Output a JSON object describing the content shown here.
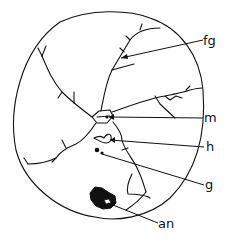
{
  "figure": {
    "type": "line-drawing",
    "labels": [
      {
        "id": "fg",
        "text": "fg",
        "x": 203,
        "y": 34,
        "target": [
          121,
          58
        ]
      },
      {
        "id": "m",
        "text": "m",
        "x": 205,
        "y": 111,
        "target": [
          106,
          117
        ]
      },
      {
        "id": "h",
        "text": "h",
        "x": 207,
        "y": 140,
        "target": [
          109,
          140
        ]
      },
      {
        "id": "g",
        "text": "g",
        "x": 206,
        "y": 179,
        "target": [
          101,
          154
        ]
      },
      {
        "id": "an",
        "text": "an",
        "x": 160,
        "y": 216,
        "target": [
          108,
          204
        ]
      }
    ],
    "colors": {
      "ink": "#111111",
      "background": "#ffffff"
    }
  }
}
